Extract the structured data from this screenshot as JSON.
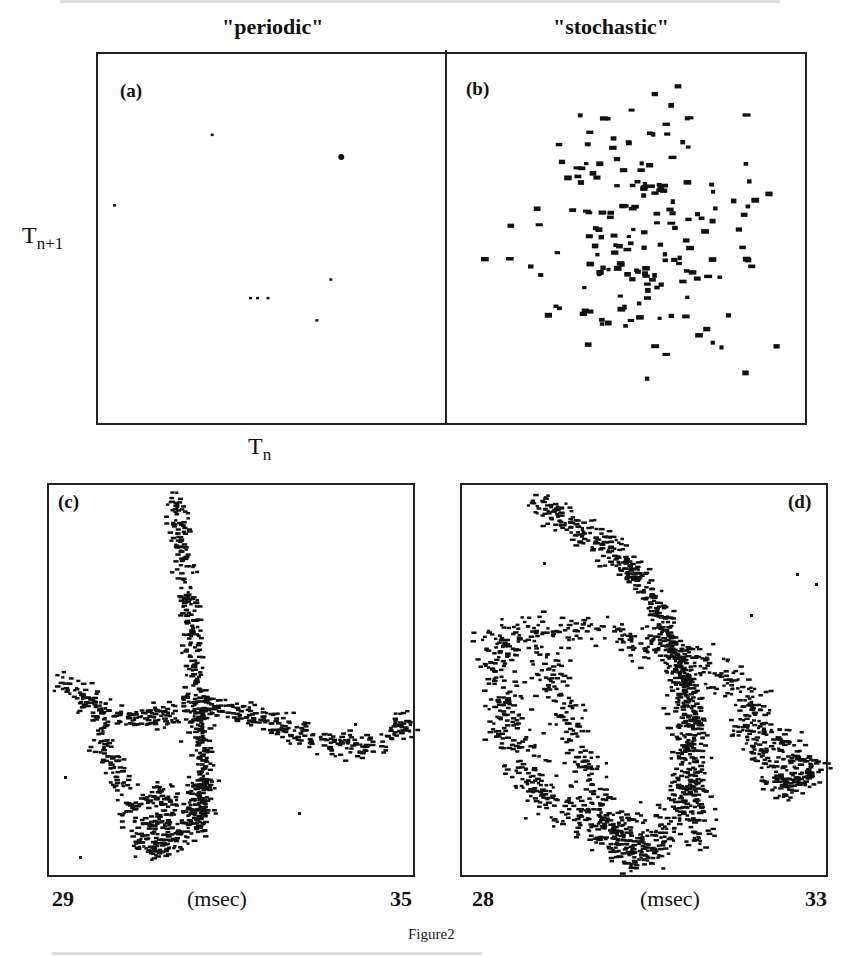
{
  "figure": {
    "caption": "Figure2",
    "column_titles": {
      "left": "\"periodic\"",
      "right": "\"stochastic\""
    },
    "axis_labels": {
      "y_main": "T",
      "y_sub": "n+1",
      "x_main": "T",
      "x_sub": "n"
    },
    "panels": {
      "a": {
        "label": "(a)"
      },
      "b": {
        "label": "(b)"
      },
      "c": {
        "label": "(c)",
        "x_min": "29",
        "x_unit": "(msec)",
        "x_max": "35"
      },
      "d": {
        "label": "(d)",
        "x_min": "28",
        "x_unit": "(msec)",
        "x_max": "33"
      }
    }
  },
  "chart_data": [
    {
      "type": "scatter",
      "title": "(a) \"periodic\" return map",
      "xlabel": "T_n",
      "ylabel": "T_{n+1}",
      "grid": false,
      "points_normalized": [
        [
          0.33,
          0.22
        ],
        [
          0.7,
          0.28,
          3
        ],
        [
          0.05,
          0.41
        ],
        [
          0.44,
          0.66
        ],
        [
          0.46,
          0.66
        ],
        [
          0.49,
          0.66
        ],
        [
          0.63,
          0.72
        ],
        [
          0.67,
          0.61
        ]
      ]
    },
    {
      "type": "scatter",
      "title": "(b) \"stochastic\" return map",
      "xlabel": "T_n",
      "ylabel": "T_{n+1}",
      "grid": false,
      "distribution": "isotropic cloud centered ~ (0.46,0.47), ~190 points"
    },
    {
      "type": "scatter",
      "title": "(c) periodic, time-delay embedding",
      "xlabel": "(msec)",
      "x_ticks": [
        "29",
        "35"
      ],
      "xlim": [
        29,
        35
      ],
      "grid": false,
      "shape": "vertical branch from top (~x 31.3) crossing a horizontal band; loop at lower-left; band rising to right end"
    },
    {
      "type": "scatter",
      "title": "(d) stochastic, time-delay embedding",
      "xlabel": "(msec)",
      "x_ticks": [
        "28",
        "33"
      ],
      "xlim": [
        28,
        33
      ],
      "grid": false,
      "shape": "diagonal tail from upper-left into tangled double loop, tail to lower-right"
    }
  ]
}
